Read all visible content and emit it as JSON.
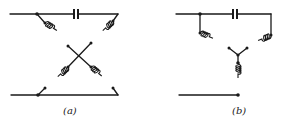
{
  "figure": {
    "panels": [
      {
        "id": "a",
        "label": "(a)",
        "description": "Lattice (bridged-X) network: series capacitor across the top, two cross-coupled inductors"
      },
      {
        "id": "b",
        "label": "(b)",
        "description": "Bridged-T network: series capacitor across the top, two shunt-arm inductors meeting at a junction, one inductor to the bottom rail"
      }
    ]
  },
  "colors": {
    "ink": "#1a1a1a",
    "background": "#ffffff"
  }
}
